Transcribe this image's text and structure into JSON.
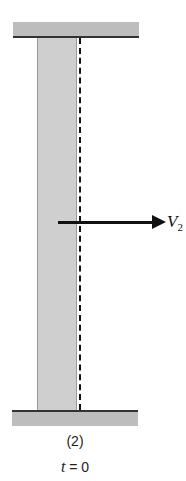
{
  "diagram": {
    "arrow_label": "V",
    "arrow_label_subscript": "2",
    "case_label": "(2)",
    "time_var": "t",
    "time_eq": " = 0",
    "colors": {
      "plate": "#bdbdbd",
      "column": "#cfcfcf",
      "line": "#111111"
    }
  }
}
